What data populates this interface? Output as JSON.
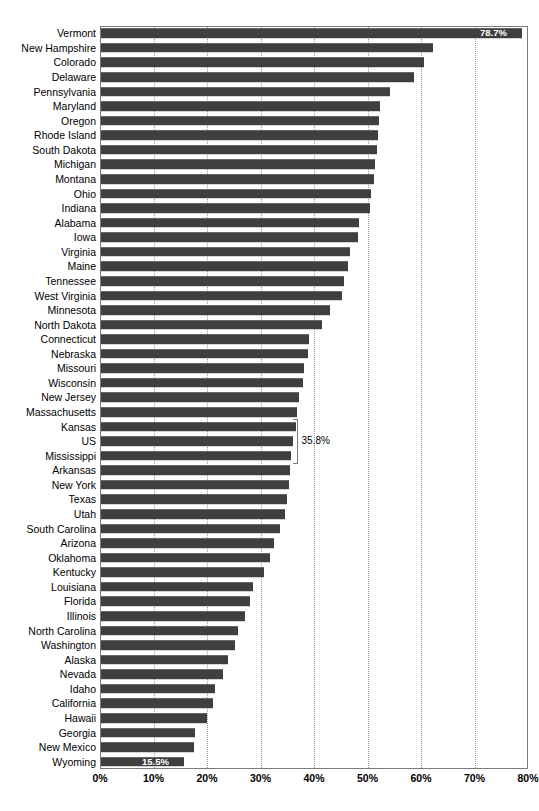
{
  "chart_data": {
    "type": "bar",
    "orientation": "horizontal",
    "title": "",
    "subtitle": "",
    "xlabel": "",
    "ylabel": "",
    "xlim": [
      0,
      80
    ],
    "xunit": "%",
    "grid": true,
    "legend": null,
    "bar_color": "#3f3f3f",
    "axis_color": "#7a7a7a",
    "gridline_color": "#9a9a9a",
    "x_ticks": [
      0,
      10,
      20,
      30,
      40,
      50,
      60,
      70,
      80
    ],
    "x_tick_labels": [
      "0%",
      "10%",
      "20%",
      "30%",
      "40%",
      "50%",
      "60%",
      "70%",
      "80%"
    ],
    "categories": [
      "Vermont",
      "New Hampshire",
      "Colorado",
      "Delaware",
      "Pennsylvania",
      "Maryland",
      "Oregon",
      "Rhode Island",
      "South Dakota",
      "Michigan",
      "Montana",
      "Ohio",
      "Indiana",
      "Alabama",
      "Iowa",
      "Virginia",
      "Maine",
      "Tennessee",
      "West Virginia",
      "Minnesota",
      "North Dakota",
      "Connecticut",
      "Nebraska",
      "Missouri",
      "Wisconsin",
      "New Jersey",
      "Massachusetts",
      "Kansas",
      "US",
      "Mississippi",
      "Arkansas",
      "New York",
      "Texas",
      "Utah",
      "South Carolina",
      "Arizona",
      "Oklahoma",
      "Kentucky",
      "Louisiana",
      "Florida",
      "Illinois",
      "North Carolina",
      "Washington",
      "Alaska",
      "Nevada",
      "Idaho",
      "California",
      "Hawaii",
      "Georgia",
      "New Mexico",
      "Wyoming"
    ],
    "values": [
      78.7,
      62.1,
      60.4,
      58.5,
      54.0,
      52.2,
      52.0,
      51.8,
      51.6,
      51.2,
      51.0,
      50.5,
      50.2,
      48.3,
      48.0,
      46.6,
      46.2,
      45.4,
      45.1,
      42.8,
      41.4,
      38.9,
      38.6,
      38.0,
      37.7,
      37.1,
      36.7,
      36.4,
      35.8,
      35.6,
      35.4,
      35.2,
      34.8,
      34.3,
      33.5,
      32.3,
      31.6,
      30.4,
      28.5,
      27.8,
      27.0,
      25.6,
      25.1,
      23.7,
      22.8,
      21.4,
      21.0,
      19.8,
      17.6,
      17.3,
      15.5
    ],
    "labeled_points": [
      {
        "category": "Vermont",
        "value": 78.7,
        "label": "78.7%",
        "style": "inside-bar-right"
      },
      {
        "category": "US",
        "value": 35.8,
        "label": "35.8%",
        "style": "bracket-callout"
      },
      {
        "category": "Wyoming",
        "value": 15.5,
        "label": "15.5%",
        "style": "inside-bar-right"
      }
    ]
  }
}
